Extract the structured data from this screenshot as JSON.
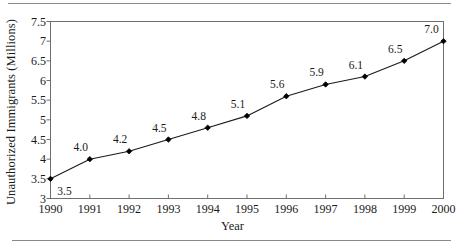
{
  "figure": {
    "background_color": "#ffffff",
    "rule_color": "#8a8a8a",
    "axis_color": "#6f6f6f",
    "line_color": "#1a1a1a",
    "marker_color": "#000000",
    "top_rule_name": "top-divider",
    "bottom_rule_name": "bottom-divider"
  },
  "chart_data": {
    "type": "line",
    "title": "",
    "xlabel": "Year",
    "ylabel": "Unauthorized Immigrants (Millions)",
    "categories": [
      "1990",
      "1991",
      "1992",
      "1993",
      "1994",
      "1995",
      "1996",
      "1997",
      "1998",
      "1999",
      "2000"
    ],
    "x": [
      1990,
      1991,
      1992,
      1993,
      1994,
      1995,
      1996,
      1997,
      1998,
      1999,
      2000
    ],
    "values": [
      3.5,
      4.0,
      4.2,
      4.5,
      4.8,
      5.1,
      5.6,
      5.9,
      6.1,
      6.5,
      7.0
    ],
    "point_labels": [
      "3.5",
      "4.0",
      "4.2",
      "4.5",
      "4.8",
      "5.1",
      "5.6",
      "5.9",
      "6.1",
      "6.5",
      "7.0"
    ],
    "ylim": [
      3,
      7.5
    ],
    "xlim": [
      1990,
      2000
    ],
    "ytick_values": [
      3,
      3.5,
      4,
      4.5,
      5,
      5.5,
      6,
      6.5,
      7,
      7.5
    ],
    "ytick_labels": [
      "3",
      "3.5",
      "4",
      "4.5",
      "5",
      "5.5",
      "6",
      "6.5",
      "7",
      "7.5"
    ],
    "xtick_labels": [
      "1990",
      "1991",
      "1992",
      "1993",
      "1994",
      "1995",
      "1996",
      "1997",
      "1998",
      "1999",
      "2000"
    ],
    "grid": false,
    "legend": false,
    "legend_position": "none",
    "marker": "diamond",
    "series": [
      {
        "name": "Unauthorized Immigrants (Millions)",
        "values": [
          3.5,
          4.0,
          4.2,
          4.5,
          4.8,
          5.1,
          5.6,
          5.9,
          6.1,
          6.5,
          7.0
        ]
      }
    ]
  }
}
